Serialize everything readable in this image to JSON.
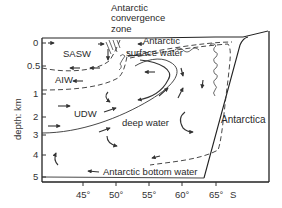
{
  "diagram": {
    "type": "oceanographic cross-section",
    "y_axis": {
      "label": "depth: km",
      "ticks": [
        {
          "label": "0",
          "y": 43
        },
        {
          "label": "0.5",
          "y": 66
        },
        {
          "label": "1",
          "y": 94
        },
        {
          "label": "2",
          "y": 117
        },
        {
          "label": "3",
          "y": 135
        },
        {
          "label": "4",
          "y": 155
        },
        {
          "label": "5",
          "y": 177
        }
      ]
    },
    "x_axis": {
      "ticks": [
        {
          "label": "45°",
          "x": 83
        },
        {
          "label": "50°",
          "x": 116
        },
        {
          "label": "55°",
          "x": 149
        },
        {
          "label": "60°",
          "x": 182
        },
        {
          "label": "65°",
          "x": 216
        }
      ],
      "unit": "S"
    },
    "labels": {
      "convergence_line1": "Antarctic",
      "convergence_line2": "convergence",
      "convergence_line3": "zone",
      "sasw": "SASW",
      "aiw": "AIW",
      "udw": "UDW",
      "surface_water_line1": "Antarctic",
      "surface_water_line2": "surface water",
      "deep_water": "deep water",
      "bottom_water": "Antarctic bottom water",
      "continent": "Antarctica"
    }
  }
}
